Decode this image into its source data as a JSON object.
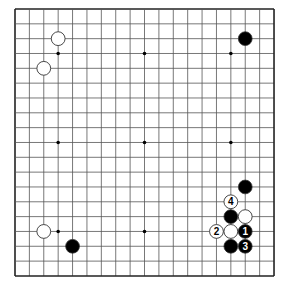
{
  "diagram": {
    "board_size": 19,
    "origin_px": [
      15,
      9
    ],
    "spacing_px": [
      14.39,
      14.83
    ],
    "colors": {
      "line": "#555555",
      "border": "#222222",
      "black": "#000000",
      "white": "#ffffff",
      "star": "#000000"
    },
    "star_points": [
      [
        3,
        3
      ],
      [
        9,
        3
      ],
      [
        15,
        3
      ],
      [
        3,
        9
      ],
      [
        9,
        9
      ],
      [
        15,
        9
      ],
      [
        3,
        15
      ],
      [
        9,
        15
      ],
      [
        15,
        15
      ]
    ],
    "stones": [
      {
        "color": "white",
        "col": 3,
        "row": 2,
        "label": ""
      },
      {
        "color": "white",
        "col": 2,
        "row": 4,
        "label": ""
      },
      {
        "color": "black",
        "col": 16,
        "row": 2,
        "label": ""
      },
      {
        "color": "white",
        "col": 2,
        "row": 15,
        "label": ""
      },
      {
        "color": "black",
        "col": 4,
        "row": 16,
        "label": ""
      },
      {
        "color": "black",
        "col": 16,
        "row": 12,
        "label": ""
      },
      {
        "color": "white",
        "col": 15,
        "row": 13,
        "label": "4"
      },
      {
        "color": "black",
        "col": 15,
        "row": 14,
        "label": ""
      },
      {
        "color": "white",
        "col": 16,
        "row": 14,
        "label": ""
      },
      {
        "color": "white",
        "col": 14,
        "row": 15,
        "label": "2"
      },
      {
        "color": "white",
        "col": 15,
        "row": 15,
        "label": ""
      },
      {
        "color": "black",
        "col": 16,
        "row": 15,
        "label": "1"
      },
      {
        "color": "black",
        "col": 15,
        "row": 16,
        "label": ""
      },
      {
        "color": "black",
        "col": 16,
        "row": 16,
        "label": "3"
      }
    ]
  }
}
